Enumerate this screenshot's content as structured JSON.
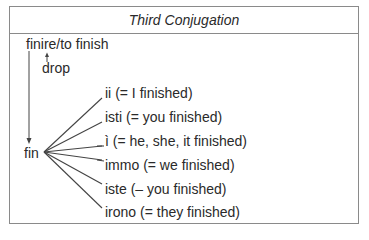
{
  "title": "Third Conjugation",
  "infinitive": "finire/to finish",
  "drop_label": "drop",
  "stem": "fin",
  "endings": [
    {
      "ending": "ii",
      "meaning": "(= I finished)"
    },
    {
      "ending": "isti",
      "meaning": "(= you finished)"
    },
    {
      "ending": "ì",
      "meaning": "(= he, she, it finished)"
    },
    {
      "ending": "immo",
      "meaning": "(= we finished)"
    },
    {
      "ending": "iste",
      "meaning": "(– you finished)"
    },
    {
      "ending": "irono",
      "meaning": "(= they finished)"
    }
  ]
}
